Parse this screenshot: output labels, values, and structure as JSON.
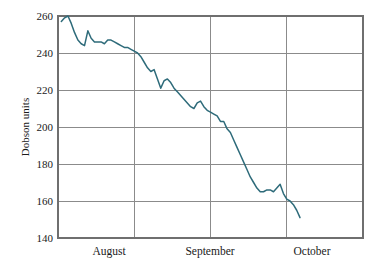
{
  "chart_data": {
    "type": "line",
    "title": "",
    "xlabel": "",
    "ylabel": "Dobson units",
    "ylim": [
      140,
      260
    ],
    "yticks": [
      140,
      160,
      180,
      200,
      220,
      240,
      260
    ],
    "ytick_labels": [
      "140",
      "160",
      "180",
      "200",
      "220",
      "240",
      "260"
    ],
    "xlim": [
      0,
      92
    ],
    "xtick_labels": [
      "August",
      "September",
      "October"
    ],
    "xtick_positions": [
      16,
      46,
      76
    ],
    "x_gridline_positions": [
      31,
      61,
      92
    ],
    "grid": "horizontal-and-vertical",
    "legend": "none",
    "line_color": "#2e6b7a",
    "series": [
      {
        "name": "Total ozone",
        "x": [
          1,
          2,
          3,
          4,
          5,
          6,
          7,
          8,
          9,
          10,
          11,
          12,
          13,
          14,
          15,
          16,
          17,
          18,
          19,
          20,
          21,
          22,
          23,
          24,
          25,
          26,
          27,
          28,
          29,
          30,
          31,
          32,
          33,
          34,
          35,
          36,
          37,
          38,
          39,
          40,
          41,
          42,
          43,
          44,
          45,
          46,
          47,
          48,
          49,
          50,
          51,
          52,
          53,
          54,
          55,
          56,
          57,
          58,
          59,
          60,
          61,
          62,
          63,
          64,
          65,
          66,
          67,
          68,
          69,
          70,
          71,
          72,
          73
        ],
        "values": [
          257,
          259,
          260,
          256,
          251,
          247,
          245,
          244,
          252,
          248,
          246,
          246,
          246,
          245,
          247,
          247,
          246,
          245,
          244,
          243,
          243,
          242,
          241,
          240,
          238,
          235,
          232,
          230,
          231,
          226,
          221,
          225,
          226,
          224,
          221,
          219,
          217,
          215,
          213,
          211,
          210,
          213,
          214,
          211,
          209,
          208,
          207,
          206,
          203,
          203,
          199,
          197,
          193,
          189,
          185,
          181,
          177,
          173,
          170,
          167,
          165,
          165,
          166,
          166,
          165,
          167,
          169,
          164,
          161,
          160,
          158,
          155,
          151
        ]
      }
    ]
  },
  "axis": {
    "y_title": "Dobson units"
  }
}
